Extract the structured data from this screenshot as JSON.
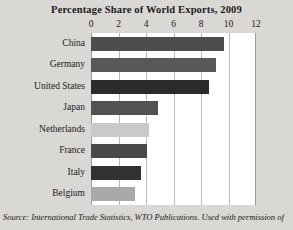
{
  "chart_data": {
    "type": "bar",
    "orientation": "horizontal",
    "title": "Percentage Share of World Exports, 2009",
    "xlabel": "",
    "ylabel": "",
    "xlim": [
      0,
      12
    ],
    "xticks": [
      0,
      2,
      4,
      6,
      8,
      10,
      12
    ],
    "xtick_labels": [
      "0",
      "2",
      "4",
      "6",
      "8",
      "10",
      "12"
    ],
    "grid": true,
    "grid_axis": "x",
    "axis_position": "top",
    "legend": false,
    "categories": [
      "China",
      "Germany",
      "United States",
      "Japan",
      "Netherlands",
      "France",
      "Italy",
      "Belgium"
    ],
    "values": [
      9.7,
      9.1,
      8.6,
      4.9,
      4.2,
      4.1,
      3.6,
      3.2
    ],
    "bar_colors": [
      "#4d4d4d",
      "#585858",
      "#2b2b2b",
      "#525252",
      "#c9c9c9",
      "#4a4a4a",
      "#323232",
      "#a9a9a9"
    ],
    "units": "percent"
  },
  "source": {
    "prefix": "Source: ",
    "publication": "International Trade Statistics",
    "suffix": ", WTO Publications. Used with permission of",
    "full": "Source: International Trade Statistics, WTO Publications. Used with permission of"
  },
  "figure": {
    "background_color": "#d9d8d4",
    "plot_background_color": "#ffffff",
    "gridline_color": "#b9b9b9"
  }
}
